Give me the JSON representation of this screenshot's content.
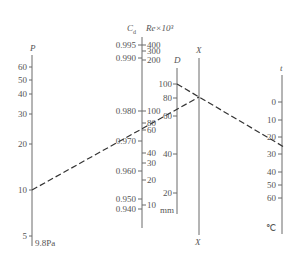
{
  "diagram": {
    "type": "nomogram",
    "line_color": "#6b6b6b",
    "dash_color": "#333333",
    "axes": {
      "P": {
        "title": "P",
        "unit": "9.8Pa",
        "ticks": [
          {
            "label": "60",
            "y": 67
          },
          {
            "label": "50",
            "y": 80
          },
          {
            "label": "40",
            "y": 94
          },
          {
            "label": "30",
            "y": 114
          },
          {
            "label": "20",
            "y": 144
          },
          {
            "label": "10",
            "y": 190
          },
          {
            "label": "5",
            "y": 236
          }
        ]
      },
      "Cd": {
        "title": "C",
        "subscript": "d",
        "ticks": [
          {
            "label": "0.995",
            "y": 45
          },
          {
            "label": "0.990",
            "y": 58
          },
          {
            "label": "0.980",
            "y": 111
          },
          {
            "label": "0.970",
            "y": 141
          },
          {
            "label": "0.960",
            "y": 171
          },
          {
            "label": "0.950",
            "y": 199
          },
          {
            "label": "0.940",
            "y": 209
          }
        ]
      },
      "Re": {
        "title": "Re×10³",
        "ticks": [
          {
            "label": "400",
            "y": 45
          },
          {
            "label": "300",
            "y": 51
          },
          {
            "label": "200",
            "y": 60
          },
          {
            "label": "100",
            "y": 111
          },
          {
            "label": "80",
            "y": 123
          },
          {
            "label": "60",
            "y": 130
          },
          {
            "label": "40",
            "y": 153
          },
          {
            "label": "30",
            "y": 163
          },
          {
            "label": "20",
            "y": 180
          },
          {
            "label": "10",
            "y": 205
          }
        ]
      },
      "D": {
        "title": "D",
        "unit": "mm",
        "ticks": [
          {
            "label": "100",
            "y": 84
          },
          {
            "label": "80",
            "y": 98
          },
          {
            "label": "60",
            "y": 116
          },
          {
            "label": "40",
            "y": 154
          },
          {
            "label": "20",
            "y": 193
          }
        ]
      },
      "X": {
        "title_top": "X",
        "title_bottom": "X"
      },
      "t": {
        "title": "t",
        "unit": "℃",
        "ticks": [
          {
            "label": "0",
            "y": 102
          },
          {
            "label": "10",
            "y": 120
          },
          {
            "label": "20",
            "y": 137
          },
          {
            "label": "30",
            "y": 154
          },
          {
            "label": "40",
            "y": 172
          },
          {
            "label": "50",
            "y": 185
          },
          {
            "label": "60",
            "y": 198
          }
        ]
      }
    },
    "isopleths": [
      {
        "from": "P=10",
        "to": "X pivot",
        "x1": 32,
        "y1": 190,
        "x2": 199,
        "y2": 97
      },
      {
        "from": "D=100",
        "to": "t≈25",
        "x1": 177,
        "y1": 84,
        "x2": 282,
        "y2": 146
      }
    ]
  }
}
